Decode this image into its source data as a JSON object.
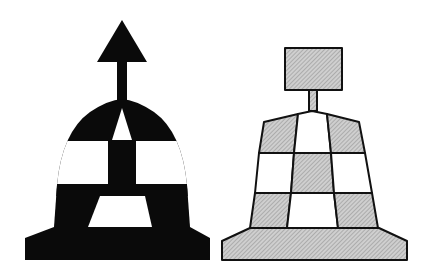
{
  "figure": {
    "colors": {
      "background": "#ffffff",
      "black": "#0a0a0a",
      "hatch_fill": "#c8c8c8",
      "hatch_line": "#8a8a8a",
      "outline": "#111111"
    },
    "buoys": [
      {
        "id": "left",
        "style": "solid black and white checkered dome",
        "topmark": "arrow-up"
      },
      {
        "id": "right",
        "style": "hatched grey and white checkered conical frustum",
        "topmark": "rectangle-flag"
      }
    ]
  }
}
